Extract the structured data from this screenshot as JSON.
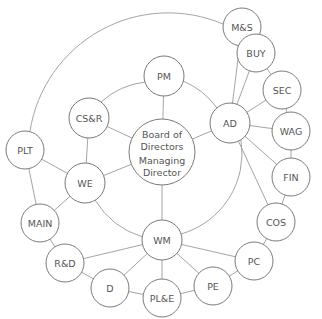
{
  "diagram": {
    "type": "organisational-network",
    "center": {
      "id": "center",
      "line1": "Board of",
      "line2": "Directors",
      "line3": "Managing",
      "line4": "Director",
      "x": 162,
      "y": 152,
      "r": 33
    },
    "nodes": [
      {
        "id": "PM",
        "label": "PM",
        "x": 164,
        "y": 76,
        "r": 20
      },
      {
        "id": "CSR",
        "label": "CS&R",
        "x": 89,
        "y": 118,
        "r": 20
      },
      {
        "id": "AD",
        "label": "AD",
        "x": 230,
        "y": 123,
        "r": 20
      },
      {
        "id": "WE",
        "label": "WE",
        "x": 85,
        "y": 183,
        "r": 20
      },
      {
        "id": "WM",
        "label": "WM",
        "x": 162,
        "y": 240,
        "r": 20
      },
      {
        "id": "MS",
        "label": "M&S",
        "x": 242,
        "y": 27,
        "r": 19
      },
      {
        "id": "BUY",
        "label": "BUY",
        "x": 256,
        "y": 53,
        "r": 19
      },
      {
        "id": "SEC",
        "label": "SEC",
        "x": 282,
        "y": 90,
        "r": 19
      },
      {
        "id": "WAG",
        "label": "WAG",
        "x": 291,
        "y": 131,
        "r": 19
      },
      {
        "id": "FIN",
        "label": "FIN",
        "x": 291,
        "y": 177,
        "r": 19
      },
      {
        "id": "COS",
        "label": "COS",
        "x": 276,
        "y": 222,
        "r": 19
      },
      {
        "id": "PC",
        "label": "PC",
        "x": 254,
        "y": 261,
        "r": 19
      },
      {
        "id": "PE",
        "label": "PE",
        "x": 213,
        "y": 286,
        "r": 19
      },
      {
        "id": "PLE",
        "label": "PL&E",
        "x": 162,
        "y": 298,
        "r": 19
      },
      {
        "id": "D",
        "label": "D",
        "x": 110,
        "y": 288,
        "r": 19
      },
      {
        "id": "RD",
        "label": "R&D",
        "x": 65,
        "y": 263,
        "r": 19
      },
      {
        "id": "MAIN",
        "label": "MAIN",
        "x": 40,
        "y": 223,
        "r": 19
      },
      {
        "id": "PLT",
        "label": "PLT",
        "x": 25,
        "y": 150,
        "r": 19
      }
    ],
    "edges": [
      [
        "center",
        "PM"
      ],
      [
        "center",
        "CSR"
      ],
      [
        "center",
        "AD"
      ],
      [
        "center",
        "WE"
      ],
      [
        "center",
        "WM"
      ],
      [
        "CSR",
        "WE"
      ],
      [
        "PLT",
        "WE"
      ],
      [
        "WE",
        "MAIN"
      ],
      [
        "PLT",
        "MAIN"
      ],
      [
        "AD",
        "MS"
      ],
      [
        "AD",
        "BUY"
      ],
      [
        "AD",
        "SEC"
      ],
      [
        "AD",
        "WAG"
      ],
      [
        "AD",
        "FIN"
      ],
      [
        "AD",
        "COS"
      ],
      [
        "MS",
        "BUY"
      ],
      [
        "BUY",
        "SEC"
      ],
      [
        "SEC",
        "WAG"
      ],
      [
        "WAG",
        "FIN"
      ],
      [
        "FIN",
        "COS"
      ],
      [
        "COS",
        "PC"
      ],
      [
        "WM",
        "PC"
      ],
      [
        "WM",
        "PE"
      ],
      [
        "WM",
        "PLE"
      ],
      [
        "WM",
        "D"
      ],
      [
        "WM",
        "RD"
      ],
      [
        "PC",
        "PE"
      ],
      [
        "PE",
        "PLE"
      ],
      [
        "PLE",
        "D"
      ],
      [
        "D",
        "RD"
      ],
      [
        "RD",
        "MAIN"
      ]
    ],
    "arcs": [
      {
        "from": "CSR",
        "to": "PM",
        "desc": "inner ring arc"
      },
      {
        "from": "PM",
        "to": "AD",
        "desc": "inner ring arc"
      },
      {
        "from": "AD",
        "to": "WM",
        "desc": "inner ring arc"
      },
      {
        "from": "WE",
        "to": "WM",
        "desc": "inner ring arc"
      },
      {
        "from": "PLT",
        "to": "MS",
        "desc": "outer ring arc"
      }
    ],
    "colors": {
      "stroke": "#7a7a7a",
      "edge": "#9a9a9a",
      "text": "#555555",
      "background": "#ffffff"
    }
  }
}
